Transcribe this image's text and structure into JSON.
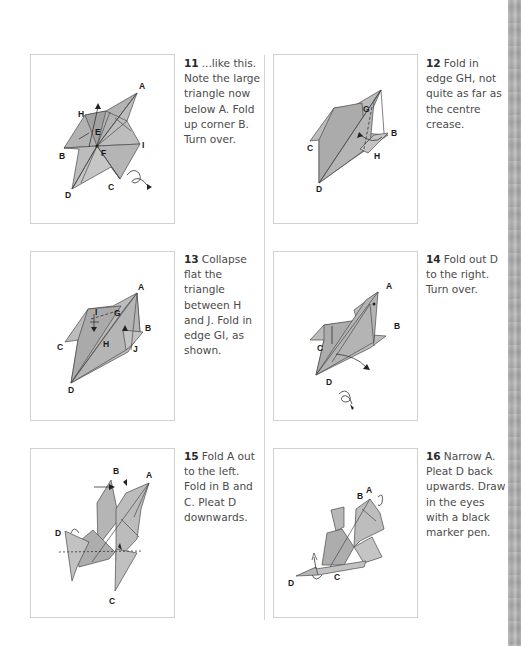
{
  "page": {
    "layout": "two-column origami instruction page",
    "colors": {
      "paper_fill": "#b7b7b7",
      "paper_dark": "#9d9d9d",
      "frame_border": "#d0d0d0",
      "divider": "#d4d4d4",
      "edge_strip": "#a8a8a8"
    }
  },
  "steps": [
    {
      "number": "11",
      "text": "...like this. Note the large triangle now below A. Fold up corner B. Turn over.",
      "labels": [
        "A",
        "H",
        "E",
        "B",
        "F",
        "I",
        "D",
        "C"
      ]
    },
    {
      "number": "12",
      "text": "Fold in edge GH, not quite as far as the centre crease.",
      "labels": [
        "G",
        "B",
        "C",
        "H",
        "D"
      ]
    },
    {
      "number": "13",
      "text": "Collapse flat the triangle between H and J. Fold in edge GI, as shown.",
      "labels": [
        "A",
        "I",
        "G",
        "B",
        "C",
        "H",
        "J",
        "D"
      ]
    },
    {
      "number": "14",
      "text": "Fold out D to the right. Turn over.",
      "labels": [
        "A",
        "B",
        "C",
        "D"
      ]
    },
    {
      "number": "15",
      "text": "Fold A out to the left. Fold in B and C. Pleat D downwards.",
      "labels": [
        "B",
        "A",
        "D",
        "C"
      ]
    },
    {
      "number": "16",
      "text": "Narrow A. Pleat D back upwards. Draw in the eyes with a black marker pen.",
      "labels": [
        "B",
        "A",
        "D",
        "C"
      ]
    }
  ]
}
